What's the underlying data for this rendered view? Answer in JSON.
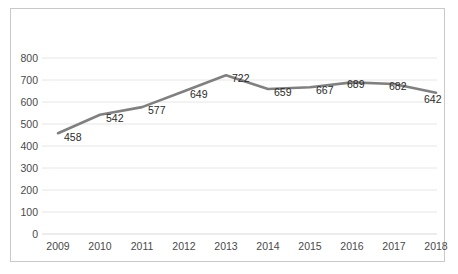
{
  "chart_data": {
    "type": "line",
    "title": "",
    "subtitle": "",
    "xlabel": "",
    "ylabel": "",
    "categories": [
      "2009",
      "2010",
      "2011",
      "2012",
      "2013",
      "2014",
      "2015",
      "2016",
      "2017",
      "2018"
    ],
    "values": [
      458,
      542,
      577,
      649,
      722,
      659,
      667,
      689,
      682,
      642
    ],
    "data_labels": [
      "458",
      "542",
      "577",
      "649",
      "722",
      "659",
      "667",
      "689",
      "682",
      "642"
    ],
    "series": [
      {
        "name": "",
        "values": [
          458,
          542,
          577,
          649,
          722,
          659,
          667,
          689,
          682,
          642
        ],
        "color": "#808080"
      }
    ],
    "ylim": [
      0,
      800
    ],
    "ytick_values": [
      800,
      700,
      600,
      500,
      400,
      300,
      200,
      100,
      0
    ],
    "ytick_labels": [
      "800",
      "700",
      "600",
      "500",
      "400",
      "300",
      "200",
      "100",
      "0"
    ],
    "xtick_labels": [
      "2009",
      "2010",
      "2011",
      "2012",
      "2013",
      "2014",
      "2015",
      "2016",
      "2017",
      "2018"
    ],
    "grid": {
      "horizontal": true,
      "vertical": false,
      "color": "#e6e6e6"
    },
    "legend": {
      "visible": false,
      "position": "none",
      "entries": []
    },
    "annotations": [],
    "colors": {
      "line": "#808080",
      "gridline": "#e6e6e6",
      "axis_text": "#4a4a4a",
      "label_text": "#2b2b2b",
      "border": "#c9c9c9",
      "background": "#ffffff"
    }
  }
}
